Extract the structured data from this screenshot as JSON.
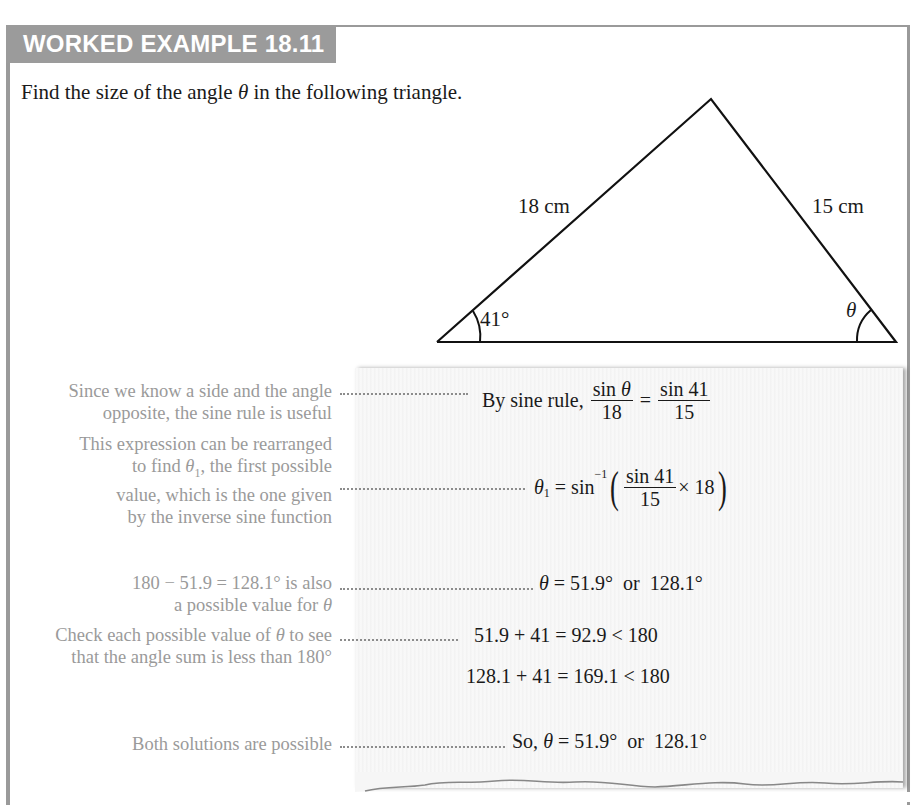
{
  "header": {
    "title": "WORKED EXAMPLE 18.11"
  },
  "question": {
    "prefix": "Find the size of the angle ",
    "symbol": "θ",
    "suffix": " in the following triangle."
  },
  "diagram": {
    "side_left": "18 cm",
    "side_right": "15 cm",
    "angle_left": "41°",
    "angle_right": "θ"
  },
  "steps": [
    {
      "note_lines": [
        "Since we know a side and the angle",
        "opposite, the sine rule is useful"
      ],
      "math": {
        "prefix": "By sine rule, ",
        "frac1_num": "sin θ",
        "frac1_den": "18",
        "eq": " = ",
        "frac2_num": "sin 41",
        "frac2_den": "15"
      }
    },
    {
      "note_lines": [
        "This expression can be rearranged",
        "to find θ₁, the first possible",
        "value, which is the one given",
        "by the inverse sine function"
      ],
      "math": {
        "lhs": "θ",
        "lhs_sub": "1",
        "eq": " = sin",
        "sup": "−1",
        "frac_num": "sin 41",
        "frac_den": "15",
        "tail": "× 18"
      }
    },
    {
      "note_lines": [
        "180 − 51.9 = 128.1° is also",
        "a possible value for θ"
      ],
      "math": {
        "text": "θ = 51.9°  or  128.1°"
      }
    },
    {
      "note_lines": [
        "Check each possible value of θ to see",
        "that the angle sum is less than 180°"
      ],
      "math": {
        "line1": "51.9 + 41 = 92.9 < 180",
        "line2": "128.1 + 41 = 169.1 < 180"
      }
    },
    {
      "note_lines": [
        "Both solutions are possible"
      ],
      "math": {
        "text": "So, θ = 51.9°  or  128.1°"
      }
    }
  ]
}
